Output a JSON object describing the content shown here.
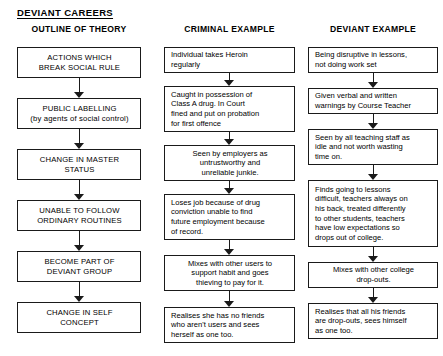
{
  "title": "DEVIANT CAREERS",
  "columns": [
    {
      "id": "outline-of-theory",
      "header": "OUTLINE OF THEORY",
      "align": "center",
      "nodes": [
        {
          "text": "ACTIONS WHICH\nBREAK SOCIAL RULE",
          "top": 47,
          "height": 31
        },
        {
          "text": "PUBLIC LABELLING\n(by agents of social control)",
          "top": 98,
          "height": 31
        },
        {
          "text": "CHANGE IN MASTER\nSTATUS",
          "top": 149,
          "height": 31
        },
        {
          "text": "UNABLE TO FOLLOW\nORDINARY ROUTINES",
          "top": 200,
          "height": 31
        },
        {
          "text": "BECOME PART OF\nDEVIANT GROUP",
          "top": 251,
          "height": 31
        },
        {
          "text": "CHANGE IN SELF\nCONCEPT",
          "top": 302,
          "height": 31
        }
      ],
      "connectors": [
        {
          "top": 78,
          "height": 20
        },
        {
          "top": 129,
          "height": 20
        },
        {
          "top": 180,
          "height": 20
        },
        {
          "top": 231,
          "height": 20
        },
        {
          "top": 282,
          "height": 20
        }
      ]
    },
    {
      "id": "criminal-example",
      "header": "CRIMINAL EXAMPLE",
      "align": "left",
      "nodes": [
        {
          "text": "Individual takes Heroin\nregularly",
          "top": 47,
          "height": 26,
          "align": "left"
        },
        {
          "text": "Caught in possession of\nClass A drug. In Court\nfined and put on probation\nfor first offence",
          "top": 86,
          "height": 46,
          "align": "left"
        },
        {
          "text": "Seen by employers as\nuntrustworthy and\nunreliable junkie.",
          "top": 145,
          "height": 36,
          "align": "center"
        },
        {
          "text": "Loses job because of drug\nconviction unable to find\nfuture employment because\nof record.",
          "top": 194,
          "height": 46,
          "align": "left"
        },
        {
          "text": "Mixes with other users to\nsupport habit and goes\nthieving to pay for it.",
          "top": 255,
          "height": 36,
          "align": "center"
        },
        {
          "text": "Realises she has no friends\nwho aren't users and sees\nherself as one too.",
          "top": 307,
          "height": 36,
          "align": "left"
        }
      ],
      "connectors": [
        {
          "top": 73,
          "height": 13
        },
        {
          "top": 132,
          "height": 13
        },
        {
          "top": 181,
          "height": 13
        },
        {
          "top": 240,
          "height": 15
        },
        {
          "top": 291,
          "height": 16
        }
      ]
    },
    {
      "id": "deviant-example",
      "header": "DEVIANT EXAMPLE",
      "align": "left",
      "nodes": [
        {
          "text": "Being disruptive in lessons,\nnot doing work set",
          "top": 47,
          "height": 26,
          "align": "left"
        },
        {
          "text": "Given verbal and written\nwarnings by Course Teacher",
          "top": 88,
          "height": 26,
          "align": "left"
        },
        {
          "text": "Seen by all teaching staff as\nidle and not worth wasting\ntime on.",
          "top": 129,
          "height": 36,
          "align": "left"
        },
        {
          "text": "Finds going to lessons\ndifficult, teachers always on\nhis back, treated differently\nto other students, teachers\nhave low expectations so\ndrops out of college.",
          "top": 180,
          "height": 67,
          "align": "left"
        },
        {
          "text": "Mixes with other college\ndrop-outs.",
          "top": 262,
          "height": 26,
          "align": "center"
        },
        {
          "text": "Realises that all his friends\nare drop-outs, sees himself\nas one too.",
          "top": 303,
          "height": 36,
          "align": "left"
        }
      ],
      "connectors": [
        {
          "top": 73,
          "height": 15
        },
        {
          "top": 114,
          "height": 15
        },
        {
          "top": 165,
          "height": 15
        },
        {
          "top": 247,
          "height": 15
        },
        {
          "top": 288,
          "height": 15
        }
      ]
    }
  ]
}
